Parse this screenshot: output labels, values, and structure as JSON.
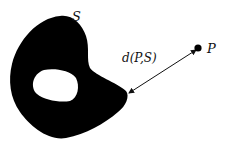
{
  "diagram": {
    "set_label": "S",
    "point_label": "P",
    "distance_label": "d(P,S)",
    "colors": {
      "set_fill": "#000000",
      "hole_fill": "#ffffff",
      "arrow": "#111111",
      "background": "#ffffff"
    },
    "point": {
      "x": 198,
      "y": 48
    },
    "arrow": {
      "from": {
        "x": 196,
        "y": 50
      },
      "to": {
        "x": 128,
        "y": 93
      }
    }
  }
}
